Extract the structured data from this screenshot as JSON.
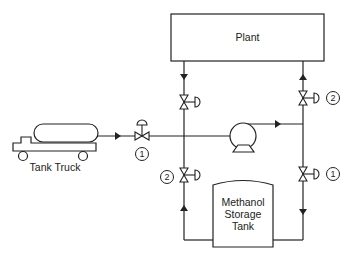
{
  "diagram": {
    "type": "process-flow",
    "nodes": {
      "plant": {
        "label": "Plant"
      },
      "tank_truck": {
        "label": "Tank Truck"
      },
      "storage_tank": {
        "label_lines": [
          "Methanol",
          "Storage",
          "Tank"
        ]
      },
      "pump": {
        "label": ""
      }
    },
    "valve_tags": {
      "truck_valve": "1",
      "left_lower_valve": "2",
      "right_upper_valve": "2",
      "right_lower_valve": "1"
    },
    "colors": {
      "line": "#222222",
      "background": "#ffffff"
    }
  }
}
